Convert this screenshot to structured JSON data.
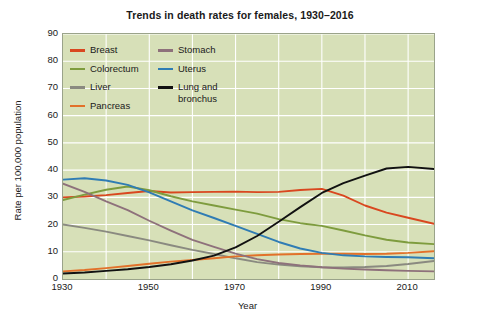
{
  "chart_data": {
    "type": "line",
    "title": "Trends in death rates for females, 1930–2016",
    "xlabel": "Year",
    "ylabel": "Rate per 100,000 population",
    "xlim": [
      1930,
      2016
    ],
    "ylim": [
      0,
      90
    ],
    "ytick_labels": [
      "0",
      "10",
      "20",
      "30",
      "40",
      "50",
      "60",
      "70",
      "80",
      "90"
    ],
    "ytick_values": [
      0,
      10,
      20,
      30,
      40,
      50,
      60,
      70,
      80,
      90
    ],
    "xtick_labels": [
      "1930",
      "1950",
      "1970",
      "1990",
      "2010"
    ],
    "xtick_values": [
      1930,
      1950,
      1970,
      1990,
      2010
    ],
    "grid": "both-minor-white",
    "legend_position": "upper-left-inside",
    "plot_background_color": "#d7e0b8",
    "gridline_color": "#ffffff",
    "x": [
      1930,
      1935,
      1940,
      1945,
      1950,
      1955,
      1960,
      1965,
      1970,
      1975,
      1980,
      1985,
      1990,
      1995,
      2000,
      2005,
      2010,
      2016
    ],
    "series": [
      {
        "name": "Breast",
        "color": "#d9471f",
        "values": [
          30.0,
          30.3,
          30.8,
          31.6,
          32.3,
          31.8,
          31.9,
          32.0,
          32.1,
          31.9,
          32.0,
          32.7,
          33.1,
          30.6,
          27.0,
          24.4,
          22.5,
          20.3
        ]
      },
      {
        "name": "Colorectum",
        "color": "#7e9c3e",
        "values": [
          29.0,
          31.0,
          32.8,
          34.0,
          32.6,
          30.4,
          28.5,
          27.0,
          25.5,
          24.0,
          22.0,
          20.5,
          19.5,
          17.8,
          16.0,
          14.4,
          13.4,
          12.8
        ]
      },
      {
        "name": "Liver",
        "color": "#8a8a80",
        "values": [
          20.0,
          18.8,
          17.4,
          15.8,
          14.2,
          12.4,
          10.7,
          9.2,
          7.6,
          6.2,
          5.3,
          4.7,
          4.3,
          4.2,
          4.4,
          4.8,
          5.5,
          6.6
        ]
      },
      {
        "name": "Pancreas",
        "color": "#e2712a",
        "values": [
          2.8,
          3.3,
          4.0,
          4.8,
          5.6,
          6.4,
          7.0,
          7.6,
          8.3,
          8.7,
          9.0,
          9.2,
          9.3,
          9.3,
          9.2,
          9.3,
          9.6,
          10.2
        ]
      },
      {
        "name": "Stomach",
        "color": "#8e717b",
        "values": [
          35.0,
          32.0,
          28.5,
          25.3,
          21.4,
          17.8,
          14.4,
          11.8,
          9.3,
          7.3,
          5.9,
          5.0,
          4.3,
          3.8,
          3.5,
          3.2,
          3.0,
          2.8
        ]
      },
      {
        "name": "Uterus",
        "color": "#2f7cb4",
        "values": [
          36.5,
          37.0,
          36.2,
          34.6,
          31.8,
          28.5,
          25.2,
          22.4,
          19.5,
          16.6,
          13.6,
          11.2,
          9.6,
          8.7,
          8.3,
          8.1,
          8.0,
          7.6
        ]
      },
      {
        "name": "Lung and bronchus",
        "color": "#111111",
        "values": [
          2.0,
          2.4,
          3.0,
          3.6,
          4.4,
          5.4,
          6.8,
          8.6,
          11.6,
          15.8,
          21.0,
          26.4,
          31.6,
          35.2,
          38.0,
          40.6,
          41.2,
          40.4
        ]
      }
    ]
  },
  "legend": {
    "columns": [
      [
        {
          "label": "Breast",
          "color": "#d9471f"
        },
        {
          "label": "Colorectum",
          "color": "#7e9c3e"
        },
        {
          "label": "Liver",
          "color": "#8a8a80"
        },
        {
          "label": "Pancreas",
          "color": "#e2712a"
        }
      ],
      [
        {
          "label": "Stomach",
          "color": "#8e717b"
        },
        {
          "label": "Uterus",
          "color": "#2f7cb4"
        },
        {
          "label": "Lung and\nbronchus",
          "color": "#111111"
        }
      ]
    ]
  }
}
